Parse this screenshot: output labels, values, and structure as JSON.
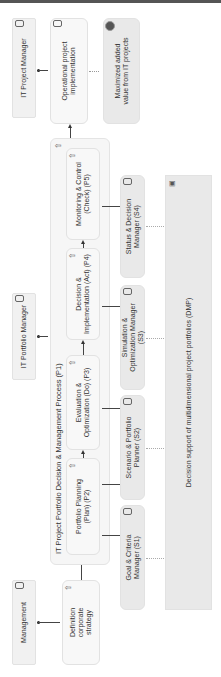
{
  "actors": {
    "it_project_manager": "IT Project Manager",
    "it_portfolio_manager": "IT Portfolio Manager",
    "management": "Management"
  },
  "activities": {
    "operational": "Operational project implementation",
    "definition": "Definition corporate strategy",
    "goal": "Maximized added value from IT projects"
  },
  "process": {
    "title": "IT Project Portfolio Decision & Management Process (P1)",
    "steps": [
      {
        "id": "P2",
        "label": "Portfolio Planning (Plan) (P2)"
      },
      {
        "id": "P3",
        "label": "Evaluation & Optimization (Do) (P3)"
      },
      {
        "id": "P4",
        "label": "Decision & Implementation (Act) (P4)"
      },
      {
        "id": "P5",
        "label": "Monitoring & Control (Check) (P5)"
      }
    ]
  },
  "systems": [
    {
      "id": "S1",
      "label": "Goal & Criteria Manager (S1)"
    },
    {
      "id": "S2",
      "label": "Scenario & Portfolio Planner (S2)"
    },
    {
      "id": "S3",
      "label": "Simulation & Optimization Manager (S3)"
    },
    {
      "id": "S4",
      "label": "Status & Decision Manager (S4)"
    }
  ],
  "dmp": {
    "label": "Decision support of multidimensional project portfolios (DMP)"
  },
  "icons": {
    "actor": "role-icon",
    "activity": "cylinder-icon",
    "step": "up-arrow-icon",
    "goal": "target-icon",
    "system": "application-icon"
  }
}
